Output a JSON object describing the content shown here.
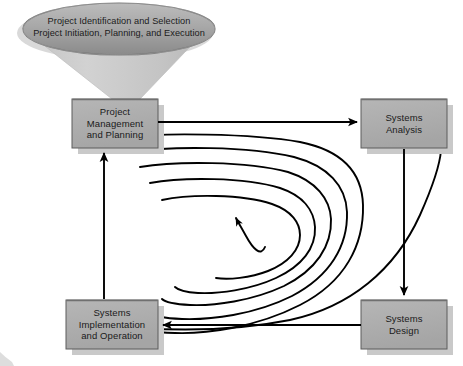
{
  "diagram": {
    "funnel": {
      "name": "funnel-input",
      "lines": "Project Identification and Selection\nProject Initiation, Planning, and Execution"
    },
    "boxes": [
      {
        "id": "project-management",
        "label": "Project\nManagement\nand Planning",
        "x": 72,
        "y": 99,
        "w": 86,
        "h": 49
      },
      {
        "id": "systems-analysis",
        "label": "Systems\nAnalysis",
        "x": 361,
        "y": 99,
        "w": 86,
        "h": 49
      },
      {
        "id": "systems-design",
        "label": "Systems\nDesign",
        "x": 361,
        "y": 300,
        "w": 86,
        "h": 49
      },
      {
        "id": "systems-implementation",
        "label": "Systems\nImplementation\nand Operation",
        "x": 66,
        "y": 300,
        "w": 92,
        "h": 49
      }
    ],
    "arrows": [
      {
        "id": "pm-to-analysis",
        "from": "project-management",
        "to": "systems-analysis",
        "direction": "right"
      },
      {
        "id": "analysis-to-design",
        "from": "systems-analysis",
        "to": "systems-design",
        "direction": "down"
      },
      {
        "id": "design-to-implementation",
        "from": "systems-design",
        "to": "systems-implementation",
        "direction": "left"
      },
      {
        "id": "implementation-to-pm",
        "from": "systems-implementation",
        "to": "project-management",
        "direction": "up"
      }
    ],
    "spiral": {
      "id": "iteration-spiral",
      "turns": 4,
      "direction": "inward-clockwise",
      "arrowhead": "center"
    },
    "colors": {
      "box_fill": "#adadad",
      "box_shadow": "#c9c9c9",
      "funnel_cone": "#c9c9c9",
      "ellipse_top": "#b4b4b4",
      "ellipse_bottom": "#8e8e8e",
      "line": "#000000",
      "background": "#ffffff",
      "text": "#1a1a1a"
    }
  }
}
